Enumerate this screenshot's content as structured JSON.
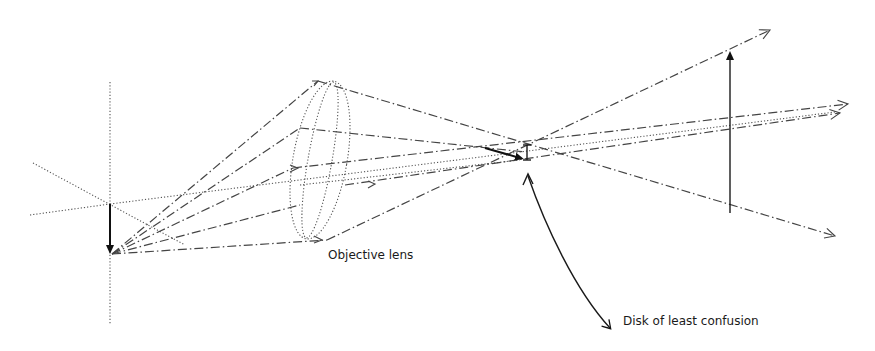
{
  "diagram": {
    "labels": {
      "lens": "Objective lens",
      "focus": "Disk of least confusion"
    },
    "elements": {
      "object_arrow": "inverted object (pointing down) on optical plane",
      "lens": "objective lens drawn as dotted ellipse",
      "image_arrow": "upright enlarged image (pointing up)",
      "disk": "small vertical bar marking disk of least confusion"
    },
    "colors": {
      "background": "#ffffff",
      "line": "#444444",
      "text": "#1a1a1a"
    }
  }
}
